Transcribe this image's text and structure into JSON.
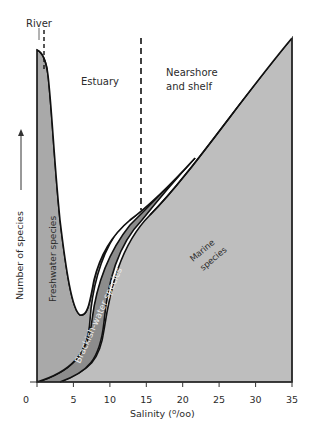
{
  "diagram": {
    "regions": {
      "river": "River",
      "estuary": "Estuary",
      "nearshore_line1": "Nearshore",
      "nearshore_line2": "and shelf"
    },
    "species": {
      "freshwater": "Freshwater species",
      "brackish": "Brackish-water species",
      "marine_line1": "Marine",
      "marine_line2": "species"
    },
    "axes": {
      "ylabel": "Number of species",
      "xlabel": "Salinity (⁰/₀₀)",
      "xlabel_text": "Salinity (",
      "xlabel_unit_sup": "o",
      "xlabel_unit_rest": "/oo)",
      "xticks": [
        "0",
        "5",
        "10",
        "15",
        "20",
        "25",
        "30",
        "35"
      ]
    },
    "colors": {
      "freshwater": "#a9a9a9",
      "brackish": "#8c8c8c",
      "marine": "#bebebe",
      "outline": "#111111"
    }
  }
}
